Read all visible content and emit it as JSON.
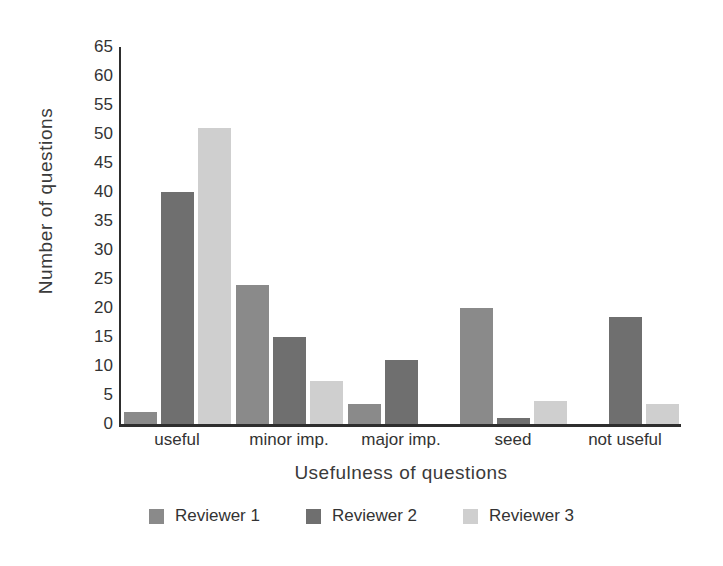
{
  "chart_data": {
    "type": "bar",
    "title": "",
    "xlabel": "Usefulness of questions",
    "ylabel": "Number of questions",
    "categories": [
      "useful",
      "minor imp.",
      "major imp.",
      "seed",
      "not useful"
    ],
    "series": [
      {
        "name": "Reviewer 1",
        "color": "#8a8a8a",
        "values": [
          2,
          24,
          3.5,
          20,
          0
        ]
      },
      {
        "name": "Reviewer 2",
        "color": "#6f6f6f",
        "values": [
          40,
          15,
          11,
          1,
          18.5
        ]
      },
      {
        "name": "Reviewer 3",
        "color": "#cfcfcf",
        "values": [
          51,
          7.5,
          0,
          4,
          3.5
        ]
      }
    ],
    "ylim": [
      0,
      65
    ],
    "ytick_step": 5,
    "yticks": [
      0,
      5,
      10,
      15,
      20,
      25,
      30,
      35,
      40,
      45,
      50,
      55,
      60,
      65
    ],
    "ytick_labels": [
      "0",
      "5",
      "10",
      "15",
      "20",
      "25",
      "30",
      "35",
      "40",
      "45",
      "50",
      "55",
      "60",
      "65"
    ],
    "grid": false,
    "legend_position": "bottom"
  }
}
